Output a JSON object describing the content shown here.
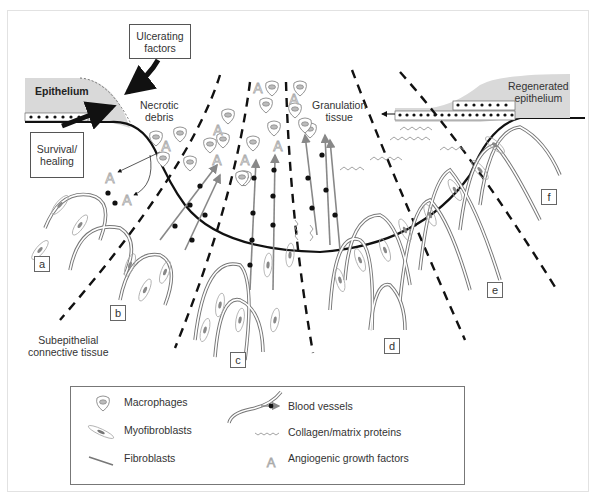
{
  "diagram": {
    "callouts": {
      "ulcerating_factors": "Ulcerating\nfactors",
      "survival_healing": "Survival/\nhealing"
    },
    "labels": {
      "epithelium": "Epithelium",
      "necrotic_debris": "Necrotic\ndebris",
      "granulation_tissue": "Granulation\ntissue",
      "regenerated_epithelium": "Regenerated\nepithelium",
      "subepithelial_connective_tissue": "Subepithelial\nconnective tissue"
    },
    "stages": [
      "a",
      "b",
      "c",
      "d",
      "e",
      "f"
    ]
  },
  "legend": {
    "items": [
      {
        "icon": "macrophage-icon",
        "label": "Macrophages"
      },
      {
        "icon": "myofibroblast-icon",
        "label": "Myofibroblasts"
      },
      {
        "icon": "fibroblast-icon",
        "label": "Fibroblasts"
      },
      {
        "icon": "blood-vessel-icon",
        "label": "Blood vessels"
      },
      {
        "icon": "collagen-icon",
        "label": "Collagen/matrix proteins"
      },
      {
        "icon": "angiogenic-factor-icon",
        "label": "Angiogenic growth factors"
      }
    ]
  },
  "colors": {
    "epithelium_fill": "#d9d9d9",
    "line": "#111111",
    "vessel_gray": "#888888"
  }
}
